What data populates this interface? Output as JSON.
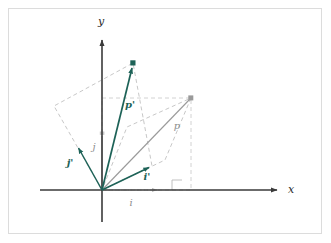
{
  "figure": {
    "background_color": "#ffffff",
    "frame_color": "#dcdcdc",
    "colors": {
      "teal": "#1d6257",
      "axis": "#3a3a3a",
      "gray": "#8d8d8d",
      "dashed_gray": "#b9b9b9",
      "light_gray": "#c9c9c9"
    }
  },
  "axes": {
    "x_label": "x",
    "y_label": "y",
    "origin": {
      "x": 102,
      "y": 190
    },
    "x_axis": {
      "x1": 40,
      "y1": 190,
      "x2": 283,
      "y2": 190
    },
    "y_axis": {
      "x1": 102,
      "y1": 222,
      "x2": 102,
      "y2": 34
    }
  },
  "vectors": [
    {
      "name": "i",
      "label": "i",
      "label_pos": {
        "x": 131,
        "y": 205
      },
      "color": "#b9b9b9",
      "style": "dotted",
      "from": {
        "x": 102,
        "y": 190
      },
      "to": {
        "x": 160,
        "y": 190
      },
      "description": "original basis vector i along x-axis"
    },
    {
      "name": "j",
      "label": "j",
      "label_pos": {
        "x": 94,
        "y": 147
      },
      "color": "#c9c9c9",
      "style": "solid",
      "from": {
        "x": 102,
        "y": 190
      },
      "to": {
        "x": 102,
        "y": 133
      },
      "description": "original basis vector j along y-axis"
    },
    {
      "name": "i-prime",
      "label": "i'",
      "label_pos": {
        "x": 145,
        "y": 178
      },
      "color": "#1d6257",
      "style": "solid",
      "from": {
        "x": 102,
        "y": 190
      },
      "to": {
        "x": 152,
        "y": 166
      },
      "description": "transformed basis vector i prime"
    },
    {
      "name": "j-prime",
      "label": "j'",
      "label_pos": {
        "x": 69,
        "y": 163
      },
      "color": "#1d6257",
      "style": "solid",
      "from": {
        "x": 102,
        "y": 190
      },
      "to": {
        "x": 76,
        "y": 144
      },
      "description": "transformed basis vector j prime"
    },
    {
      "name": "p",
      "label": "p",
      "label_pos": {
        "x": 176,
        "y": 127
      },
      "color": "#8d8d8d",
      "style": "solid",
      "from": {
        "x": 102,
        "y": 190
      },
      "to": {
        "x": 191,
        "y": 98
      },
      "description": "original point vector p"
    },
    {
      "name": "p-prime",
      "label": "p'",
      "label_pos": {
        "x": 128,
        "y": 106
      },
      "color": "#1d6257",
      "style": "solid",
      "from": {
        "x": 102,
        "y": 190
      },
      "to": {
        "x": 133,
        "y": 63
      },
      "description": "transformed point vector p prime"
    }
  ],
  "dashed_shapes": [
    {
      "name": "rotated-parallelogram",
      "color": "#b9b9b9",
      "points": [
        {
          "x": 102,
          "y": 190
        },
        {
          "x": 152,
          "y": 166
        },
        {
          "x": 133,
          "y": 63
        },
        {
          "x": 54,
          "y": 106
        }
      ],
      "description": "parallelogram spanned by i' and j' through p'"
    },
    {
      "name": "axis-aligned-rectangle",
      "color": "#b9b9b9",
      "points": [
        {
          "x": 102,
          "y": 190
        },
        {
          "x": 191,
          "y": 190
        },
        {
          "x": 191,
          "y": 98
        },
        {
          "x": 102,
          "y": 98
        }
      ],
      "description": "rectangle from origin to p along axes"
    },
    {
      "name": "rotated-inner-parallelogram",
      "color": "#b9b9b9",
      "points": [
        {
          "x": 102,
          "y": 190
        },
        {
          "x": 165,
          "y": 160
        },
        {
          "x": 191,
          "y": 98
        },
        {
          "x": 127,
          "y": 127
        }
      ],
      "description": "parallelogram spanned by scaled i' and j' through p"
    }
  ],
  "markers": [
    {
      "name": "right-angle-marker",
      "x": 172,
      "y": 180,
      "size": 10,
      "color": "#b9b9b9"
    },
    {
      "name": "point-marker-p",
      "x": 191,
      "y": 98,
      "color": "#8d8d8d"
    },
    {
      "name": "point-marker-p-prime",
      "x": 133,
      "y": 63,
      "color": "#1d6257"
    },
    {
      "name": "tick-marker-i",
      "x": 160,
      "y": 190,
      "color": "#b9b9b9"
    },
    {
      "name": "tick-marker-j",
      "x": 102,
      "y": 133,
      "color": "#c9c9c9"
    }
  ]
}
